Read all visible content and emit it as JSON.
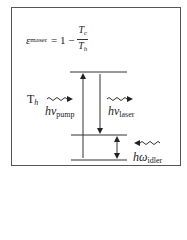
{
  "equation": {
    "lhs_symbol": "ε",
    "lhs_subscript": "maser",
    "operator": "= 1 −",
    "numerator": "T",
    "numerator_subscript": "c",
    "denominator": "T",
    "denominator_subscript": "h"
  },
  "labels": {
    "hot_bath": "T",
    "hot_bath_subscript": "h",
    "pump": "hν",
    "pump_subscript": "pump",
    "laser": "hν",
    "laser_subscript": "laser",
    "idler": "hω",
    "idler_subscript": "idler"
  },
  "levels": [
    {
      "name": "upper-level",
      "y": 72
    },
    {
      "name": "middle-level",
      "y": 135
    },
    {
      "name": "lower-level",
      "y": 160
    }
  ],
  "colors": {
    "line": "#333333",
    "frame": "#555555",
    "background": "#ffffff"
  }
}
